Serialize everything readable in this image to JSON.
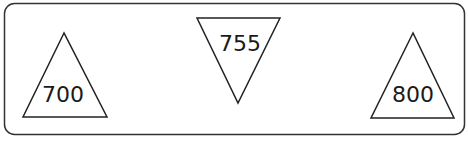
{
  "diagram": {
    "frame": {
      "stroke": "#333333"
    },
    "triangles": [
      {
        "id": "left",
        "orientation": "up",
        "value": "700"
      },
      {
        "id": "middle",
        "orientation": "down",
        "value": "755"
      },
      {
        "id": "right",
        "orientation": "up",
        "value": "800"
      }
    ]
  }
}
